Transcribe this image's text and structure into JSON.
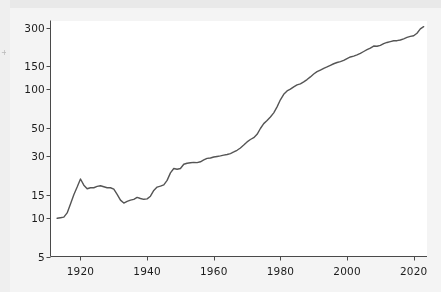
{
  "figure": {
    "background_color": "#f4f4f4",
    "plot_background_color": "#ffffff",
    "line_color": "#555555",
    "axis_color": "#4a4a4a",
    "text_color": "#1c1c1c",
    "edge_fragment": "+"
  },
  "chart_data": {
    "type": "line",
    "title": "",
    "subtitle": "",
    "xlabel": "",
    "ylabel": "",
    "yscale": "log",
    "xscale": "linear",
    "grid": false,
    "legend": null,
    "xlim": [
      1911,
      2024
    ],
    "ylim": [
      5,
      340
    ],
    "xticks": [
      1920,
      1940,
      1960,
      1980,
      2000,
      2020
    ],
    "xtick_labels": [
      "1920",
      "1940",
      "1960",
      "1980",
      "2000",
      "2020"
    ],
    "yticks": [
      5,
      10,
      15,
      30,
      50,
      100,
      150,
      300
    ],
    "ytick_labels": [
      "5",
      "10",
      "15",
      "30",
      "50",
      "100",
      "150",
      "300"
    ],
    "series": [
      {
        "name": "series-1",
        "color": "#555555",
        "linewidth": 1.4,
        "x": [
          1913,
          1914,
          1915,
          1916,
          1917,
          1918,
          1919,
          1920,
          1921,
          1922,
          1923,
          1924,
          1925,
          1926,
          1927,
          1928,
          1929,
          1930,
          1931,
          1932,
          1933,
          1934,
          1935,
          1936,
          1937,
          1938,
          1939,
          1940,
          1941,
          1942,
          1943,
          1944,
          1945,
          1946,
          1947,
          1948,
          1949,
          1950,
          1951,
          1952,
          1953,
          1954,
          1955,
          1956,
          1957,
          1958,
          1959,
          1960,
          1961,
          1962,
          1963,
          1964,
          1965,
          1966,
          1967,
          1968,
          1969,
          1970,
          1971,
          1972,
          1973,
          1974,
          1975,
          1976,
          1977,
          1978,
          1979,
          1980,
          1981,
          1982,
          1983,
          1984,
          1985,
          1986,
          1987,
          1988,
          1989,
          1990,
          1991,
          1992,
          1993,
          1994,
          1995,
          1996,
          1997,
          1998,
          1999,
          2000,
          2001,
          2002,
          2003,
          2004,
          2005,
          2006,
          2007,
          2008,
          2009,
          2010,
          2011,
          2012,
          2013,
          2014,
          2015,
          2016,
          2017,
          2018,
          2019,
          2020,
          2021,
          2022,
          2023
        ],
        "y": [
          9.9,
          10.0,
          10.1,
          10.9,
          12.8,
          15.1,
          17.3,
          20.0,
          17.9,
          16.8,
          17.1,
          17.1,
          17.5,
          17.7,
          17.4,
          17.1,
          17.1,
          16.7,
          15.2,
          13.7,
          13.0,
          13.4,
          13.7,
          13.9,
          14.4,
          14.1,
          13.9,
          14.0,
          14.7,
          16.3,
          17.3,
          17.6,
          18.0,
          19.5,
          22.3,
          24.1,
          23.8,
          24.1,
          26.0,
          26.5,
          26.7,
          26.9,
          26.8,
          27.2,
          28.1,
          28.9,
          29.1,
          29.6,
          29.9,
          30.2,
          30.6,
          31.0,
          31.5,
          32.4,
          33.4,
          34.8,
          36.7,
          38.8,
          40.5,
          41.8,
          44.4,
          49.3,
          53.8,
          56.9,
          60.6,
          65.2,
          72.6,
          82.4,
          90.9,
          96.5,
          99.6,
          103.9,
          107.6,
          109.6,
          113.6,
          118.3,
          124.0,
          130.7,
          136.2,
          140.3,
          144.5,
          148.2,
          152.4,
          156.9,
          160.5,
          163.0,
          166.6,
          172.2,
          177.1,
          179.9,
          184.0,
          188.9,
          195.3,
          201.6,
          207.3,
          215.3,
          214.5,
          218.1,
          224.9,
          229.6,
          233.0,
          236.7,
          237.0,
          240.0,
          245.1,
          251.1,
          255.7,
          258.8,
          270.9,
          292.7,
          304.7
        ]
      }
    ]
  },
  "axes": {
    "y_tick_items": [
      {
        "label": "300",
        "value": 300
      },
      {
        "label": "150",
        "value": 150
      },
      {
        "label": "100",
        "value": 100
      },
      {
        "label": "50",
        "value": 50
      },
      {
        "label": "30",
        "value": 30
      },
      {
        "label": "15",
        "value": 15
      },
      {
        "label": "10",
        "value": 10
      },
      {
        "label": "5",
        "value": 5
      }
    ],
    "x_tick_items": [
      {
        "label": "1920",
        "value": 1920
      },
      {
        "label": "1940",
        "value": 1940
      },
      {
        "label": "1960",
        "value": 1960
      },
      {
        "label": "1980",
        "value": 1980
      },
      {
        "label": "2000",
        "value": 2000
      },
      {
        "label": "2020",
        "value": 2020
      }
    ]
  }
}
